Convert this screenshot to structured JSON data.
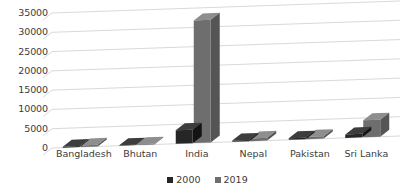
{
  "chart_data": {
    "type": "bar",
    "title": "",
    "subtitle": "",
    "xlabel": "",
    "ylabel": "",
    "categories": [
      "Bangladesh",
      "Bhutan",
      "India",
      "Nepal",
      "Pakistan",
      "Sri Lanka"
    ],
    "series": [
      {
        "name": "2000",
        "color": "#262626",
        "values": [
          260,
          120,
          3500,
          300,
          380,
          900
        ]
      },
      {
        "name": "2019",
        "color": "#6e6e6e",
        "values": [
          420,
          200,
          31800,
          700,
          620,
          4400
        ]
      }
    ],
    "ylim": [
      0,
      35000
    ],
    "yticks": [
      0,
      5000,
      10000,
      15000,
      20000,
      25000,
      30000,
      35000
    ],
    "ytick_labels": [
      "0",
      "5000",
      "10000",
      "15000",
      "20000",
      "25000",
      "30000",
      "35000"
    ],
    "grid": true,
    "grid_axis": "y",
    "legend": true,
    "legend_position": "bottom",
    "legend_entries": [
      "2000",
      "2019"
    ],
    "style": "3d-clustered-column"
  },
  "colors": {
    "series_2000": "#262626",
    "series_2019": "#6e6e6e",
    "series_2000_top": "#3d3d3d",
    "series_2000_side": "#141414",
    "series_2019_top": "#8e8e8e",
    "series_2019_side": "#555555",
    "gridline": "#d9d9d9",
    "text": "#3b3b3b",
    "background": "#ffffff"
  }
}
